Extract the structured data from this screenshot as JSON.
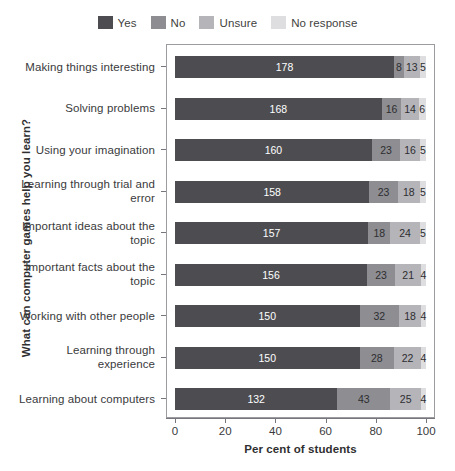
{
  "chart_data": {
    "type": "bar",
    "subtype": "stacked-horizontal",
    "title": "",
    "xlabel": "Per cent of students",
    "ylabel": "What can computer games help you learn?",
    "xlim": [
      0,
      100
    ],
    "xticks": [
      0,
      20,
      40,
      60,
      80,
      100
    ],
    "grid": false,
    "legend_position": "top-center",
    "categories": [
      "Making things interesting",
      "Solving problems",
      "Using your imagination",
      "Learning through trial and error",
      "Important ideas about the topic",
      "Important facts about the topic",
      "Working with other people",
      "Learning through experience",
      "Learning about computers"
    ],
    "series": [
      {
        "name": "Yes",
        "color": "#4d4d51",
        "values": [
          178,
          168,
          160,
          158,
          157,
          156,
          150,
          150,
          132
        ]
      },
      {
        "name": "No",
        "color": "#8d8d92",
        "values": [
          8,
          16,
          23,
          23,
          18,
          23,
          32,
          28,
          43
        ]
      },
      {
        "name": "Unsure",
        "color": "#b4b4b9",
        "values": [
          13,
          14,
          16,
          18,
          24,
          21,
          18,
          22,
          25
        ]
      },
      {
        "name": "No response",
        "color": "#dedee1",
        "values": [
          5,
          6,
          5,
          5,
          5,
          4,
          4,
          4,
          4
        ]
      }
    ]
  },
  "legend": {
    "items": [
      {
        "label": "Yes",
        "color": "#4d4d51"
      },
      {
        "label": "No",
        "color": "#8d8d92"
      },
      {
        "label": "Unsure",
        "color": "#b4b4b9"
      },
      {
        "label": "No response",
        "color": "#dedee1"
      }
    ]
  },
  "axes": {
    "x_title": "Per cent of students",
    "y_title": "What can computer games help you learn?",
    "x_tick_labels": [
      "0",
      "20",
      "40",
      "60",
      "80",
      "100"
    ]
  }
}
